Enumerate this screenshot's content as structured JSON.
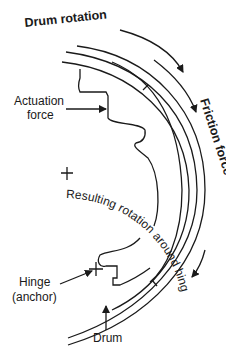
{
  "diagram": {
    "labels": {
      "drum_rotation": "Drum rotation",
      "friction_force": "Friction force",
      "actuation_force_line1": "Actuation",
      "actuation_force_line2": "force",
      "resulting_rotation": "Resulting rotation around hinge",
      "hinge_line1": "Hinge",
      "hinge_line2": "(anchor)",
      "drum": "Drum"
    },
    "colors": {
      "stroke": "#1a1a1a",
      "background": "#ffffff"
    }
  }
}
